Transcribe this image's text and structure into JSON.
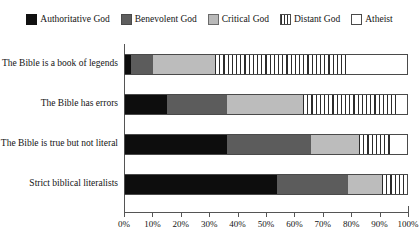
{
  "chart_data": {
    "type": "bar",
    "orientation": "horizontal",
    "stacked": true,
    "stacked_mode": "percent",
    "title": "",
    "subtitle": "",
    "xlabel": "",
    "ylabel": "",
    "xlim": [
      0,
      100
    ],
    "grid": false,
    "legend_position": "top-center",
    "xticks": [
      0,
      10,
      20,
      30,
      40,
      50,
      60,
      70,
      80,
      90,
      100
    ],
    "xtick_labels": [
      "0%",
      "10%",
      "20%",
      "30%",
      "40%",
      "50%",
      "60%",
      "70%",
      "80%",
      "90%",
      "100%"
    ],
    "categories": [
      "The Bible is a book of legends",
      "The Bible has errors",
      "The Bible is true but not literal",
      "Strict biblical literalists"
    ],
    "series": [
      {
        "name": "Authoritative God",
        "swatch": "solid-black",
        "color": "#0d0d0d",
        "values": [
          2,
          15,
          36,
          54
        ]
      },
      {
        "name": "Benevolent God",
        "swatch": "solid-dark-gray",
        "color": "#5c5c5c",
        "values": [
          8,
          21,
          30,
          25
        ]
      },
      {
        "name": "Critical God",
        "swatch": "solid-light-gray",
        "color": "#bcbcbc",
        "values": [
          22,
          27,
          17,
          12
        ]
      },
      {
        "name": "Distant God",
        "swatch": "vertical-stripes",
        "color": "#2b2b2b",
        "values": [
          47,
          33,
          12,
          8
        ]
      },
      {
        "name": "Atheist",
        "swatch": "white-outline",
        "color": "#ffffff",
        "values": [
          21,
          4,
          5,
          1
        ]
      }
    ]
  },
  "legend": {
    "items": [
      {
        "label": "Authoritative God",
        "swatch_class": "sw-authoritative"
      },
      {
        "label": "Benevolent God",
        "swatch_class": "sw-benevolent"
      },
      {
        "label": "Critical God",
        "swatch_class": "sw-critical"
      },
      {
        "label": "Distant God",
        "swatch_class": "sw-distant"
      },
      {
        "label": "Atheist",
        "swatch_class": "sw-atheist"
      }
    ]
  }
}
